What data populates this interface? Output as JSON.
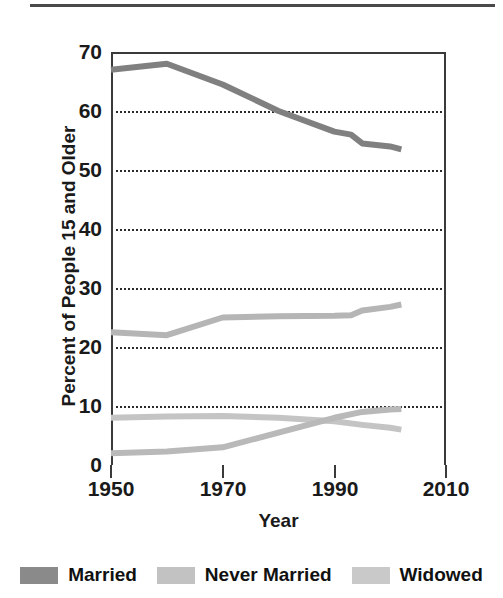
{
  "figure": {
    "has_top_rule": true
  },
  "chart_data": {
    "type": "line",
    "title": "",
    "xlabel": "Year",
    "ylabel": "Percent of People 15 and Older",
    "xlim": [
      1950,
      2010
    ],
    "ylim": [
      0,
      70
    ],
    "xticks": [
      "1950",
      "1970",
      "1990",
      "2010"
    ],
    "xtick_values": [
      1950,
      1970,
      1990,
      2010
    ],
    "yticks": [
      "0",
      "10",
      "20",
      "30",
      "40",
      "50",
      "60",
      "70"
    ],
    "ytick_values": [
      0,
      10,
      20,
      30,
      40,
      50,
      60,
      70
    ],
    "grid": "horizontal-dotted",
    "legend_position": "bottom",
    "series": [
      {
        "name": "Married",
        "color": "#808080",
        "x": [
          1950,
          1960,
          1970,
          1980,
          1990,
          1993,
          1995,
          2000,
          2002
        ],
        "values": [
          67.0,
          68.0,
          64.5,
          60.0,
          56.5,
          56.0,
          54.5,
          54.0,
          53.5
        ]
      },
      {
        "name": "Never Married",
        "color": "#b5b5b5",
        "x": [
          1950,
          1960,
          1970,
          1980,
          1990,
          1993,
          1995,
          2000,
          2002
        ],
        "values": [
          22.5,
          22.0,
          25.0,
          25.2,
          25.3,
          25.4,
          26.2,
          26.8,
          27.2
        ]
      },
      {
        "name": "Widowed",
        "color": "#c4c4c4",
        "x": [
          1950,
          1960,
          1970,
          1980,
          1990,
          1995,
          2000,
          2002
        ],
        "values": [
          8.0,
          8.2,
          8.3,
          8.0,
          7.4,
          6.8,
          6.3,
          6.0
        ]
      },
      {
        "name": "Divorced",
        "color": "#b9b9b9",
        "x": [
          1950,
          1960,
          1970,
          1980,
          1990,
          1995,
          2000,
          2002
        ],
        "values": [
          2.0,
          2.3,
          3.0,
          5.5,
          8.0,
          9.0,
          9.4,
          9.5
        ]
      }
    ],
    "legend": [
      {
        "label": "Married",
        "color": "#8a8a8a"
      },
      {
        "label": "Never Married",
        "color": "#c2c2c2"
      },
      {
        "label": "Widowed",
        "color": "#c9c9c9"
      }
    ]
  }
}
